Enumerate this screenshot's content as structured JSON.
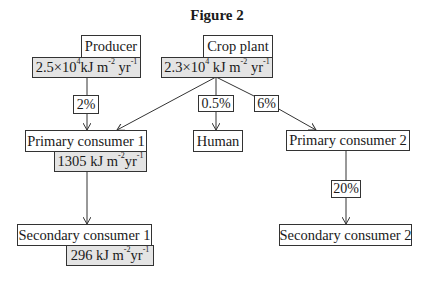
{
  "title": "Figure 2",
  "nodes": {
    "producer": {
      "label": "Producer",
      "value_mantissa": "2.5×10",
      "value_exp": "4",
      "value_unit_a": "kJ m",
      "value_unit_exp1": "-2",
      "value_unit_b": "yr",
      "value_unit_exp2": "-1"
    },
    "crop_plant": {
      "label": "Crop plant",
      "value_mantissa": "2.3×10",
      "value_exp": "4",
      "value_unit_a": " kJ m",
      "value_unit_exp1": "-2",
      "value_unit_b": "yr",
      "value_unit_exp2": "-1"
    },
    "primary_consumer_1": {
      "label": "Primary consumer 1",
      "value_number": "1305 kJ m",
      "value_unit_exp1": "-2",
      "value_unit_b": "yr",
      "value_unit_exp2": "-1"
    },
    "human": {
      "label": "Human"
    },
    "primary_consumer_2": {
      "label": "Primary consumer 2"
    },
    "secondary_consumer_1": {
      "label": "Secondary consumer 1",
      "value_number": "296 kJ m",
      "value_unit_exp1": "-2",
      "value_unit_b": "yr",
      "value_unit_exp2": "-1"
    },
    "secondary_consumer_2": {
      "label": "Secondary consumer 2"
    }
  },
  "edges": [
    {
      "from": "Producer",
      "to": "Primary consumer 1",
      "label": "2%"
    },
    {
      "from": "Crop plant",
      "to": "Primary consumer 1",
      "label": ""
    },
    {
      "from": "Crop plant",
      "to": "Human",
      "label": "0.5%"
    },
    {
      "from": "Crop plant",
      "to": "Primary consumer 2",
      "label": "6%"
    },
    {
      "from": "Primary consumer 1",
      "to": "Secondary consumer 1",
      "label": ""
    },
    {
      "from": "Primary consumer 2",
      "to": "Secondary consumer 2",
      "label": "20%"
    }
  ],
  "edge_labels": {
    "producer_to_pc1": "2%",
    "crop_to_human": "0.5%",
    "crop_to_pc2": "6%",
    "pc2_to_sc2": "20%"
  }
}
